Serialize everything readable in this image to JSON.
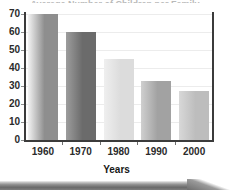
{
  "figure": {
    "clipped_title": "Average Number of Children per Family",
    "background_color": "#ffffff",
    "axis_color": "#3b3b3b",
    "grid_color": "#ececec",
    "grid_visible": true
  },
  "chart_data": {
    "type": "bar",
    "title": "",
    "xlabel": "Years",
    "ylabel": "",
    "categories": [
      "1960",
      "1970",
      "1980",
      "1990",
      "2000"
    ],
    "values": [
      70,
      60,
      45,
      33,
      27
    ],
    "ylim": [
      0,
      70
    ],
    "yticks": [
      0,
      10,
      20,
      30,
      40,
      50,
      60,
      70
    ],
    "ytick_labels": [
      "0",
      "10",
      "20",
      "30",
      "40",
      "50",
      "60",
      "70"
    ],
    "grid": true,
    "legend": null,
    "bar_colors": [
      "#9a9a9a",
      "#7b7b7b",
      "#e0e0e0",
      "#adadad",
      "#c6c6c6"
    ],
    "bar_gradients": [
      {
        "from": "#f3f3f3",
        "to": "#8e8e8e"
      },
      {
        "from": "#9d9d9d",
        "to": "#6b6b6b"
      },
      {
        "from": "#efefef",
        "to": "#dcdcdc"
      },
      {
        "from": "#cfcfcf",
        "to": "#a2a2a2"
      },
      {
        "from": "#d8d8d8",
        "to": "#bdbdbd"
      }
    ]
  }
}
